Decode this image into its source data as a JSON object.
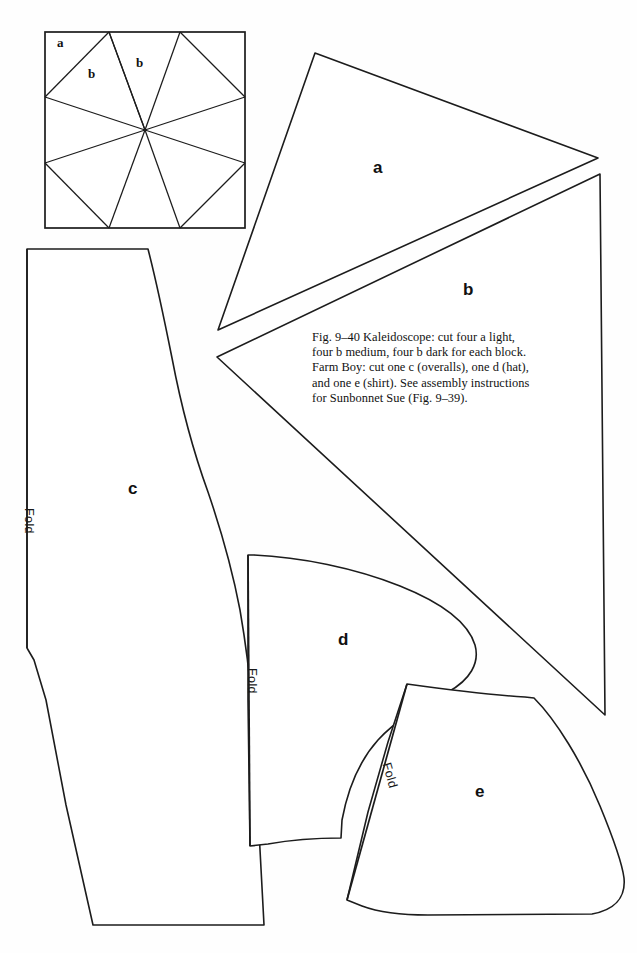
{
  "figure": {
    "caption": "Fig. 9–40 Kaleidoscope: cut four a light, four b medium, four b dark for each block. Farm Boy: cut one c (overalls), one d (hat), and one e (shirt). See assembly instructions for Sunbonnet Sue (Fig. 9–39).",
    "background_color": "#fefefe",
    "line_color": "#1c1c1c"
  },
  "block_diagram": {
    "name": "Kaleidoscope block",
    "labels": [
      {
        "text": "a",
        "role": "corner-triangle-light"
      },
      {
        "text": "b",
        "role": "radial-triangle-medium"
      },
      {
        "text": "b",
        "role": "radial-triangle-dark"
      }
    ]
  },
  "pattern_pieces": [
    {
      "id": "a",
      "label": "a",
      "name": "kaleidoscope-triangle-a",
      "fold": null
    },
    {
      "id": "b",
      "label": "b",
      "name": "kaleidoscope-triangle-b",
      "fold": null
    },
    {
      "id": "c",
      "label": "c",
      "name": "overalls-piece-c",
      "fold": "Fold"
    },
    {
      "id": "d",
      "label": "d",
      "name": "hat-piece-d",
      "fold": "Fold"
    },
    {
      "id": "e",
      "label": "e",
      "name": "shirt-piece-e",
      "fold": "Fold"
    }
  ],
  "fold_markings": {
    "c_fold": "Fold",
    "d_fold": "Fold",
    "e_fold": "Fold"
  }
}
